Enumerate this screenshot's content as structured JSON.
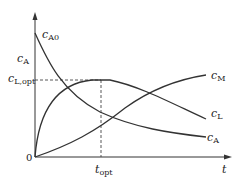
{
  "diagram": {
    "axes": {
      "x_label": "t",
      "y_label": "c_A",
      "origin_label": "0"
    },
    "labels": {
      "cA0_main": "c",
      "cA0_sub": "A0",
      "cA_axis_main": "c",
      "cA_axis_sub": "A",
      "cLopt_main": "c",
      "cLopt_sub": "L,opt",
      "topt_main": "t",
      "topt_sub": "opt",
      "cM_main": "c",
      "cM_sub": "M",
      "cL_main": "c",
      "cL_sub": "L",
      "cA_main": "c",
      "cA_sub": "A"
    },
    "curves": [
      {
        "name": "c_A",
        "description": "exponential decay from c_A0"
      },
      {
        "name": "c_L",
        "description": "rises to maximum c_L,opt at t_opt then decays"
      },
      {
        "name": "c_M",
        "description": "monotonically increasing product"
      }
    ],
    "colors": {
      "line": "#333333",
      "dash": "#444444"
    }
  }
}
